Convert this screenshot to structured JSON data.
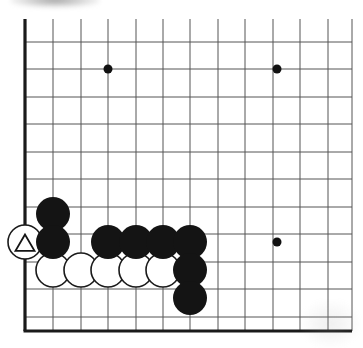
{
  "figure": {
    "kind": "go-board-diagram",
    "background_color": "#ffffff"
  },
  "board": {
    "line_color": "#555555",
    "edge_color": "#1a1a1a",
    "line_width": 1,
    "edge_width": 3.2,
    "grid_spacing": 27.5,
    "origin_x": 25,
    "origin_y": 42,
    "left_edge_x": 25,
    "bottom_edge_y": 331,
    "top_cut_y": 19,
    "right_cut_x": 352,
    "columns": 12,
    "rows": 11,
    "vertical_lines_x": [
      25,
      53,
      81,
      108,
      136,
      163,
      190,
      218,
      245,
      273,
      300,
      328,
      352
    ],
    "horizontal_lines_y": [
      42,
      69,
      97,
      124,
      152,
      179,
      207,
      234,
      262,
      289,
      317,
      331
    ]
  },
  "star_points": {
    "radius": 4.5,
    "color": "#111111",
    "points": [
      {
        "name": "star-point-upper-left",
        "x": 108,
        "y": 69
      },
      {
        "name": "star-point-upper-right",
        "x": 277,
        "y": 69
      },
      {
        "name": "star-point-lower-right",
        "x": 277,
        "y": 242
      }
    ]
  },
  "stones": {
    "radius": 17,
    "black_fill": "#141414",
    "white_fill": "#ffffff",
    "white_stroke": "#1a1a1a",
    "stroke_width": 1.6,
    "black": [
      {
        "name": "black-stone-1",
        "x": 53,
        "y": 214
      },
      {
        "name": "black-stone-2",
        "x": 53,
        "y": 242
      },
      {
        "name": "black-stone-3",
        "x": 108,
        "y": 242
      },
      {
        "name": "black-stone-4",
        "x": 136,
        "y": 242
      },
      {
        "name": "black-stone-5",
        "x": 163,
        "y": 242
      },
      {
        "name": "black-stone-6",
        "x": 190,
        "y": 242
      },
      {
        "name": "black-stone-7",
        "x": 190,
        "y": 270
      },
      {
        "name": "black-stone-8",
        "x": 190,
        "y": 298
      }
    ],
    "white": [
      {
        "name": "white-stone-marked-triangle",
        "x": 25,
        "y": 242,
        "marker": "triangle"
      },
      {
        "name": "white-stone-1",
        "x": 53,
        "y": 270,
        "marker": "none"
      },
      {
        "name": "white-stone-2",
        "x": 81,
        "y": 270,
        "marker": "none"
      },
      {
        "name": "white-stone-3",
        "x": 108,
        "y": 270,
        "marker": "none"
      },
      {
        "name": "white-stone-4",
        "x": 136,
        "y": 270,
        "marker": "none"
      },
      {
        "name": "white-stone-5",
        "x": 163,
        "y": 270,
        "marker": "none"
      }
    ]
  },
  "markers": {
    "triangle": {
      "name": "triangle-marker",
      "color": "#141414",
      "stroke_width": 1.8,
      "size": 19
    }
  }
}
